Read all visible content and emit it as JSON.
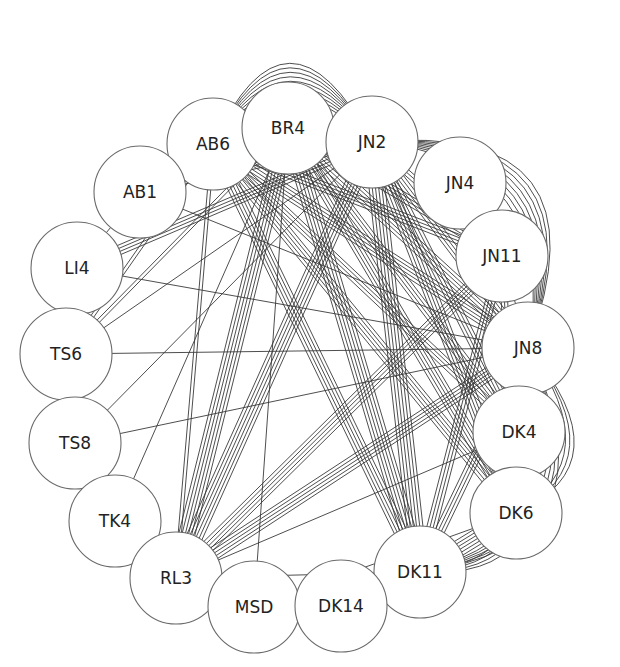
{
  "diagram": {
    "type": "network-graph",
    "node_radius": 46,
    "colors": {
      "background": "#ffffff",
      "edge": "#3a3a3a",
      "node_stroke": "#6a6a6a",
      "node_fill": "#ffffff",
      "label": "#222222"
    },
    "nodes": [
      {
        "id": "AB6",
        "label": "AB6",
        "x": 213,
        "y": 144
      },
      {
        "id": "BR4",
        "label": "BR4",
        "x": 288,
        "y": 128
      },
      {
        "id": "JN2",
        "label": "JN2",
        "x": 372,
        "y": 142
      },
      {
        "id": "JN4",
        "label": "JN4",
        "x": 460,
        "y": 183
      },
      {
        "id": "AB1",
        "label": "AB1",
        "x": 140,
        "y": 192
      },
      {
        "id": "JN11",
        "label": "JN11",
        "x": 502,
        "y": 256
      },
      {
        "id": "LI4",
        "label": "LI4",
        "x": 77,
        "y": 268
      },
      {
        "id": "JN8",
        "label": "JN8",
        "x": 528,
        "y": 348
      },
      {
        "id": "TS6",
        "label": "TS6",
        "x": 66,
        "y": 354
      },
      {
        "id": "TS8",
        "label": "TS8",
        "x": 75,
        "y": 443
      },
      {
        "id": "DK4",
        "label": "DK4",
        "x": 519,
        "y": 432
      },
      {
        "id": "TK4",
        "label": "TK4",
        "x": 115,
        "y": 521
      },
      {
        "id": "DK6",
        "label": "DK6",
        "x": 516,
        "y": 513
      },
      {
        "id": "RL3",
        "label": "RL3",
        "x": 176,
        "y": 578
      },
      {
        "id": "DK11",
        "label": "DK11",
        "x": 420,
        "y": 572
      },
      {
        "id": "MSD",
        "label": "MSD",
        "x": 254,
        "y": 607
      },
      {
        "id": "DK14",
        "label": "DK14",
        "x": 341,
        "y": 606
      }
    ],
    "edges": [
      {
        "from": "AB6",
        "to": "JN2",
        "count": 9,
        "style": "arc-top"
      },
      {
        "from": "AB6",
        "to": "BR4",
        "count": 7,
        "style": "straight"
      },
      {
        "from": "BR4",
        "to": "JN2",
        "count": 8,
        "style": "straight"
      },
      {
        "from": "JN2",
        "to": "JN8",
        "count": 8,
        "style": "arc-right"
      },
      {
        "from": "JN8",
        "to": "DK11",
        "count": 5,
        "style": "arc-right"
      },
      {
        "from": "DK4",
        "to": "DK11",
        "count": 4,
        "style": "arc-right"
      },
      {
        "from": "JN8",
        "to": "DK6",
        "count": 3,
        "style": "arc-right"
      },
      {
        "from": "DK6",
        "to": "DK11",
        "count": 6,
        "style": "straight"
      },
      {
        "from": "JN8",
        "to": "DK4",
        "count": 2,
        "style": "straight"
      },
      {
        "from": "JN11",
        "to": "JN8",
        "count": 1,
        "style": "straight"
      },
      {
        "from": "AB6",
        "to": "AB1",
        "count": 1,
        "style": "straight"
      },
      {
        "from": "AB1",
        "to": "LI4",
        "count": 1,
        "style": "straight"
      },
      {
        "from": "AB1",
        "to": "JN2",
        "count": 2,
        "style": "straight"
      },
      {
        "from": "AB1",
        "to": "JN8",
        "count": 1,
        "style": "straight"
      },
      {
        "from": "LI4",
        "to": "JN2",
        "count": 4,
        "style": "straight"
      },
      {
        "from": "LI4",
        "to": "JN8",
        "count": 1,
        "style": "straight"
      },
      {
        "from": "TS6",
        "to": "JN8",
        "count": 1,
        "style": "straight"
      },
      {
        "from": "TS6",
        "to": "AB6",
        "count": 2,
        "style": "straight"
      },
      {
        "from": "TS6",
        "to": "BR4",
        "count": 2,
        "style": "straight"
      },
      {
        "from": "TS6",
        "to": "JN2",
        "count": 1,
        "style": "straight"
      },
      {
        "from": "TS8",
        "to": "JN8",
        "count": 1,
        "style": "straight"
      },
      {
        "from": "TS8",
        "to": "JN2",
        "count": 1,
        "style": "straight"
      },
      {
        "from": "TK4",
        "to": "BR4",
        "count": 1,
        "style": "straight"
      },
      {
        "from": "RL3",
        "to": "AB6",
        "count": 2,
        "style": "straight"
      },
      {
        "from": "RL3",
        "to": "BR4",
        "count": 6,
        "style": "straight"
      },
      {
        "from": "RL3",
        "to": "JN2",
        "count": 6,
        "style": "straight"
      },
      {
        "from": "RL3",
        "to": "JN11",
        "count": 5,
        "style": "straight"
      },
      {
        "from": "RL3",
        "to": "JN8",
        "count": 5,
        "style": "straight"
      },
      {
        "from": "RL3",
        "to": "DK4",
        "count": 1,
        "style": "straight"
      },
      {
        "from": "RL3",
        "to": "DK11",
        "count": 1,
        "style": "straight"
      },
      {
        "from": "MSD",
        "to": "BR4",
        "count": 1,
        "style": "straight"
      },
      {
        "from": "MSD",
        "to": "DK6",
        "count": 1,
        "style": "straight"
      },
      {
        "from": "DK11",
        "to": "AB6",
        "count": 5,
        "style": "straight"
      },
      {
        "from": "DK11",
        "to": "BR4",
        "count": 6,
        "style": "straight"
      },
      {
        "from": "DK11",
        "to": "JN2",
        "count": 6,
        "style": "straight"
      },
      {
        "from": "DK11",
        "to": "JN11",
        "count": 4,
        "style": "straight"
      },
      {
        "from": "DK11",
        "to": "JN8",
        "count": 4,
        "style": "straight"
      },
      {
        "from": "DK6",
        "to": "AB6",
        "count": 5,
        "style": "straight"
      },
      {
        "from": "DK6",
        "to": "BR4",
        "count": 5,
        "style": "straight"
      },
      {
        "from": "DK6",
        "to": "JN2",
        "count": 5,
        "style": "straight"
      },
      {
        "from": "DK6",
        "to": "JN11",
        "count": 3,
        "style": "straight"
      },
      {
        "from": "DK4",
        "to": "AB6",
        "count": 4,
        "style": "straight"
      },
      {
        "from": "DK4",
        "to": "BR4",
        "count": 4,
        "style": "straight"
      },
      {
        "from": "DK4",
        "to": "JN2",
        "count": 4,
        "style": "straight"
      },
      {
        "from": "JN8",
        "to": "AB6",
        "count": 5,
        "style": "straight"
      },
      {
        "from": "JN8",
        "to": "BR4",
        "count": 5,
        "style": "straight"
      },
      {
        "from": "JN8",
        "to": "JN2",
        "count": 4,
        "style": "straight"
      },
      {
        "from": "JN11",
        "to": "AB6",
        "count": 4,
        "style": "straight"
      },
      {
        "from": "JN11",
        "to": "BR4",
        "count": 4,
        "style": "straight"
      },
      {
        "from": "JN11",
        "to": "JN2",
        "count": 3,
        "style": "straight"
      }
    ]
  }
}
